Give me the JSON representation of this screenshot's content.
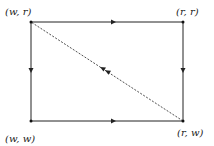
{
  "diagram": {
    "nodes": [
      {
        "id": "wr",
        "label": "(w, r)",
        "x": 31,
        "y": 22
      },
      {
        "id": "rr",
        "label": "(r, r)",
        "x": 183,
        "y": 22
      },
      {
        "id": "ww",
        "label": "(w, w)",
        "x": 31,
        "y": 121
      },
      {
        "id": "rw",
        "label": "(r, w)",
        "x": 183,
        "y": 121
      }
    ],
    "edges": [
      {
        "from": "wr",
        "to": "rr",
        "style": "solid",
        "arrow": "single"
      },
      {
        "from": "wr",
        "to": "ww",
        "style": "solid",
        "arrow": "single"
      },
      {
        "from": "ww",
        "to": "rw",
        "style": "solid",
        "arrow": "single"
      },
      {
        "from": "rr",
        "to": "rw",
        "style": "solid",
        "arrow": "single"
      },
      {
        "from": "rw",
        "to": "wr",
        "style": "dashed",
        "arrow": "double"
      }
    ]
  }
}
